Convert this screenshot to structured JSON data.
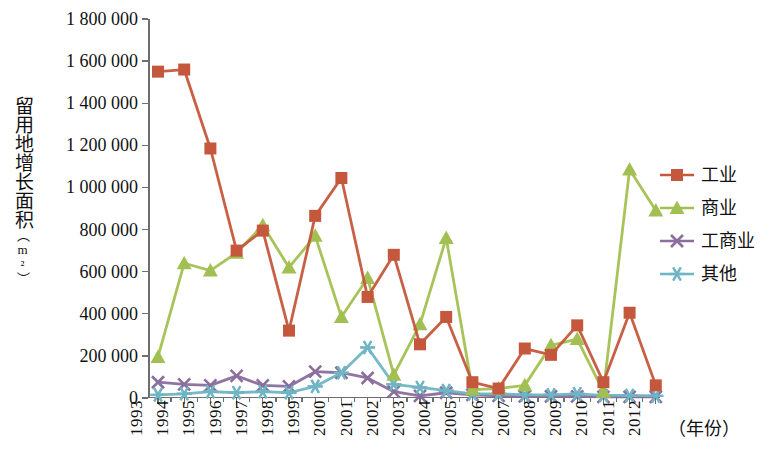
{
  "chart_data": {
    "type": "line",
    "title": "",
    "xlabel": "（年份）",
    "ylabel": "留用地增长面积（m²）",
    "ylabel_main": "留用地增长面积",
    "ylabel_unit": "（m²）",
    "x": [
      1993,
      1994,
      1995,
      1996,
      1997,
      1998,
      1999,
      2000,
      2001,
      2002,
      2003,
      2004,
      2005,
      2006,
      2007,
      2008,
      2009,
      2010,
      2011,
      2012
    ],
    "categories": [
      "1993",
      "1994",
      "1995",
      "1996",
      "1997",
      "1998",
      "1999",
      "2000",
      "2001",
      "2002",
      "2003",
      "2004",
      "2005",
      "2006",
      "2007",
      "2008",
      "2009",
      "2010",
      "2011",
      "2012"
    ],
    "ylim": [
      0,
      1800000
    ],
    "yticks": [
      0,
      200000,
      400000,
      600000,
      800000,
      1000000,
      1200000,
      1400000,
      1600000,
      1800000
    ],
    "ytick_labels": [
      "0",
      "200 000",
      "400 000",
      "600 000",
      "800 000",
      "1 000 000",
      "1 200 000",
      "1 400 000",
      "1 600 000",
      "1 800 000"
    ],
    "grid": false,
    "legend_position": "right",
    "series": [
      {
        "name": "工业",
        "color": "#c5573c",
        "marker": "square",
        "values": [
          1550000,
          1560000,
          1185000,
          700000,
          795000,
          320000,
          865000,
          1045000,
          480000,
          680000,
          255000,
          385000,
          75000,
          45000,
          235000,
          205000,
          345000,
          75000,
          405000,
          60000
        ]
      },
      {
        "name": "商业",
        "color": "#a2c051",
        "marker": "triangle",
        "values": [
          195000,
          640000,
          605000,
          690000,
          820000,
          620000,
          770000,
          385000,
          570000,
          110000,
          350000,
          760000,
          40000,
          45000,
          60000,
          250000,
          280000,
          30000,
          1085000,
          890000
        ]
      },
      {
        "name": "工商业",
        "color": "#8a6e9e",
        "marker": "x",
        "values": [
          75000,
          65000,
          60000,
          105000,
          60000,
          55000,
          125000,
          120000,
          95000,
          30000,
          10000,
          25000,
          15000,
          10000,
          8000,
          8000,
          8000,
          5000,
          5000,
          5000
        ]
      },
      {
        "name": "其他",
        "color": "#6fb5c4",
        "marker": "asterisk",
        "values": [
          15000,
          20000,
          30000,
          25000,
          30000,
          25000,
          55000,
          120000,
          240000,
          65000,
          50000,
          35000,
          20000,
          20000,
          15000,
          15000,
          20000,
          12000,
          12000,
          10000
        ]
      }
    ]
  },
  "legend": {
    "items": [
      {
        "label": "工业",
        "color": "#c5573c",
        "marker": "square"
      },
      {
        "label": "商业",
        "color": "#a2c051",
        "marker": "triangle"
      },
      {
        "label": "工商业",
        "color": "#8a6e9e",
        "marker": "x"
      },
      {
        "label": "其他",
        "color": "#6fb5c4",
        "marker": "asterisk"
      }
    ]
  }
}
